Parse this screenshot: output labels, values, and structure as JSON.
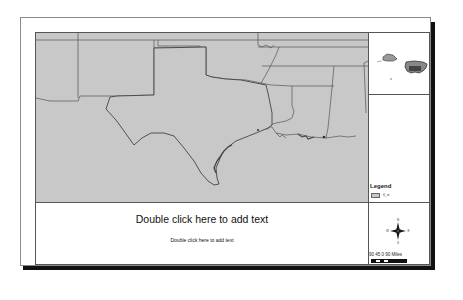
{
  "layout": {
    "title_placeholder": "Double click here to add text",
    "subtitle_placeholder": "Double click here to add text"
  },
  "map": {
    "fill_color": "#c8c8c8",
    "outline_color": "#555555",
    "features": [
      "Texas",
      "New Mexico",
      "Oklahoma",
      "Arkansas",
      "Louisiana",
      "Mississippi",
      "Alabama",
      "Kansas",
      "Colorado",
      "Missouri",
      "Tennessee"
    ]
  },
  "inset": {
    "description": "United States overview locator map"
  },
  "legend": {
    "title": "Legend",
    "items": [
      {
        "label": "tl_st",
        "color": "#c8c8c8"
      }
    ]
  },
  "north_arrow": {
    "labels": [
      "N",
      "E",
      "S",
      "W"
    ]
  },
  "scale_bar": {
    "labels": "90  45  0        90 Miles",
    "unit": "Miles"
  }
}
